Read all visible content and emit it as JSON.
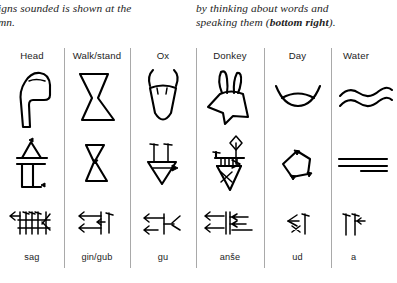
{
  "caption": {
    "left": {
      "lines": [
        "igns sounded is shown at the",
        "mn."
      ]
    },
    "right": {
      "line1": "by thinking about words and",
      "line2_prefix": "speaking them (",
      "line2_bold": "bottom right",
      "line2_suffix": ")."
    }
  },
  "table": {
    "row_labels": [
      "pictograph",
      "intermediate",
      "cuneiform"
    ],
    "columns": [
      {
        "header": "Head",
        "footer": "sag",
        "pictograph_icon": "head-pictograph-icon",
        "intermediate_icon": "head-intermediate-icon",
        "cuneiform_icon": "head-cuneiform-icon"
      },
      {
        "header": "Walk/stand",
        "footer": "gin/gub",
        "pictograph_icon": "walk-stand-pictograph-icon",
        "intermediate_icon": "walk-stand-intermediate-icon",
        "cuneiform_icon": "walk-stand-cuneiform-icon"
      },
      {
        "header": "Ox",
        "footer": "gu",
        "pictograph_icon": "ox-pictograph-icon",
        "intermediate_icon": "ox-intermediate-icon",
        "cuneiform_icon": "ox-cuneiform-icon"
      },
      {
        "header": "Donkey",
        "footer": "anše",
        "pictograph_icon": "donkey-pictograph-icon",
        "intermediate_icon": "donkey-intermediate-icon",
        "cuneiform_icon": "donkey-cuneiform-icon"
      },
      {
        "header": "Day",
        "footer": "ud",
        "pictograph_icon": "day-pictograph-icon",
        "intermediate_icon": "day-intermediate-icon",
        "cuneiform_icon": "day-cuneiform-icon"
      },
      {
        "header": "Water",
        "footer": "a",
        "pictograph_icon": "water-pictograph-icon",
        "intermediate_icon": "water-intermediate-icon",
        "cuneiform_icon": "water-cuneiform-icon"
      }
    ]
  },
  "colors": {
    "background": "#ffffff",
    "ink": "#000000",
    "text": "#1c1c1c",
    "divider": "#a9a9a9"
  }
}
